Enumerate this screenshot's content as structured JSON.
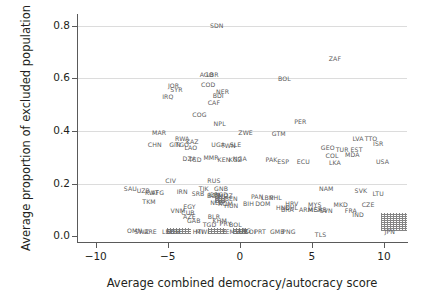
{
  "chart_data": {
    "type": "scatter",
    "title": "",
    "xlabel": "Average combined democracy/autocracy score",
    "ylabel": "Average proportion of excluded population",
    "xlim": [
      -11.3,
      11.6
    ],
    "ylim": [
      -0.022,
      0.845
    ],
    "xticks": [
      -10,
      -5,
      0,
      5,
      10
    ],
    "xtick_labels": [
      "−10",
      "−5",
      "0",
      "5",
      "10"
    ],
    "yticks": [
      0.0,
      0.2,
      0.4,
      0.6,
      0.8
    ],
    "ytick_labels": [
      "0.0",
      "0.2",
      "0.4",
      "0.6",
      "0.8"
    ],
    "grid": "horizontal",
    "legend": "none",
    "marker_style": "text-labels (ISO3 country codes)",
    "grid_color": "#dcdcdc",
    "label_color": "#5b5b5b",
    "axis_color": "#5a5a5a",
    "points": [
      {
        "label": "SDN",
        "x": -1.6,
        "y": 0.805
      },
      {
        "label": "AGO",
        "x": -2.3,
        "y": 0.617
      },
      {
        "label": "LBR",
        "x": -1.9,
        "y": 0.617
      },
      {
        "label": "COD",
        "x": -2.2,
        "y": 0.578
      },
      {
        "label": "JOR",
        "x": -4.6,
        "y": 0.575
      },
      {
        "label": "SYR",
        "x": -4.4,
        "y": 0.558
      },
      {
        "label": "NER",
        "x": -1.2,
        "y": 0.553
      },
      {
        "label": "BDI",
        "x": -1.5,
        "y": 0.538
      },
      {
        "label": "IRQ",
        "x": -5.0,
        "y": 0.535
      },
      {
        "label": "CAF",
        "x": -1.8,
        "y": 0.512
      },
      {
        "label": "COG",
        "x": -2.8,
        "y": 0.465
      },
      {
        "label": "NPL",
        "x": -1.4,
        "y": 0.432
      },
      {
        "label": "ZAF",
        "x": 6.6,
        "y": 0.678
      },
      {
        "label": "BOL",
        "x": 3.1,
        "y": 0.603
      },
      {
        "label": "PER",
        "x": 4.2,
        "y": 0.437
      },
      {
        "label": "MAR",
        "x": -5.6,
        "y": 0.398
      },
      {
        "label": "ZWE",
        "x": 0.4,
        "y": 0.398
      },
      {
        "label": "GTM",
        "x": 2.7,
        "y": 0.392
      },
      {
        "label": "RWA",
        "x": -4.0,
        "y": 0.375
      },
      {
        "label": "KAZ",
        "x": -3.3,
        "y": 0.362
      },
      {
        "label": "CHN",
        "x": -5.9,
        "y": 0.352
      },
      {
        "label": "GIN",
        "x": -4.5,
        "y": 0.352
      },
      {
        "label": "TGO",
        "x": -4.0,
        "y": 0.352
      },
      {
        "label": "UGA",
        "x": -1.5,
        "y": 0.352
      },
      {
        "label": "TWN",
        "x": -0.8,
        "y": 0.348
      },
      {
        "label": "SLE",
        "x": -0.3,
        "y": 0.352
      },
      {
        "label": "LAO",
        "x": -3.4,
        "y": 0.34
      },
      {
        "label": "LVA",
        "x": 8.2,
        "y": 0.372
      },
      {
        "label": "TTO",
        "x": 9.1,
        "y": 0.375
      },
      {
        "label": "ISR",
        "x": 9.6,
        "y": 0.355
      },
      {
        "label": "GEO",
        "x": 6.1,
        "y": 0.34
      },
      {
        "label": "TUR",
        "x": 7.1,
        "y": 0.33
      },
      {
        "label": "EST",
        "x": 8.1,
        "y": 0.33
      },
      {
        "label": "MDA",
        "x": 7.8,
        "y": 0.312
      },
      {
        "label": "COL",
        "x": 6.4,
        "y": 0.31
      },
      {
        "label": "DZA",
        "x": -3.5,
        "y": 0.297
      },
      {
        "label": "TCD",
        "x": -3.1,
        "y": 0.295
      },
      {
        "label": "MMR",
        "x": -2.0,
        "y": 0.3
      },
      {
        "label": "KEN",
        "x": -1.1,
        "y": 0.295
      },
      {
        "label": "KGZ",
        "x": -0.3,
        "y": 0.292
      },
      {
        "label": "NGA",
        "x": 0.0,
        "y": 0.297
      },
      {
        "label": "PAK",
        "x": 2.2,
        "y": 0.292
      },
      {
        "label": "ESP",
        "x": 3.0,
        "y": 0.285
      },
      {
        "label": "ECU",
        "x": 4.4,
        "y": 0.287
      },
      {
        "label": "LKA",
        "x": 6.6,
        "y": 0.283
      },
      {
        "label": "USA",
        "x": 9.9,
        "y": 0.285
      },
      {
        "label": "CIV",
        "x": -4.8,
        "y": 0.215
      },
      {
        "label": "RUS",
        "x": -1.8,
        "y": 0.215
      },
      {
        "label": "SAU",
        "x": -7.6,
        "y": 0.185
      },
      {
        "label": "UZB",
        "x": -6.7,
        "y": 0.175
      },
      {
        "label": "KWT",
        "x": -6.1,
        "y": 0.17
      },
      {
        "label": "AFG",
        "x": -5.7,
        "y": 0.17
      },
      {
        "label": "IRN",
        "x": -4.0,
        "y": 0.173
      },
      {
        "label": "TJK",
        "x": -2.5,
        "y": 0.182
      },
      {
        "label": "GNB",
        "x": -1.3,
        "y": 0.182
      },
      {
        "label": "SRB",
        "x": -2.9,
        "y": 0.165
      },
      {
        "label": "IDN",
        "x": -1.8,
        "y": 0.16
      },
      {
        "label": "BGD",
        "x": -1.3,
        "y": 0.16
      },
      {
        "label": "MOZ",
        "x": -1.0,
        "y": 0.155
      },
      {
        "label": "BEN",
        "x": -0.6,
        "y": 0.145
      },
      {
        "label": "NIC",
        "x": -1.3,
        "y": 0.142
      },
      {
        "label": "NLD",
        "x": -1.6,
        "y": 0.13
      },
      {
        "label": "TKM",
        "x": -6.3,
        "y": 0.135
      },
      {
        "label": "ROM",
        "x": -1.0,
        "y": 0.128
      },
      {
        "label": "HUN",
        "x": -0.6,
        "y": 0.118
      },
      {
        "label": "EGY",
        "x": -3.5,
        "y": 0.115
      },
      {
        "label": "VNM",
        "x": -4.3,
        "y": 0.098
      },
      {
        "label": "CUB",
        "x": -3.6,
        "y": 0.092
      },
      {
        "label": "AZE",
        "x": -3.5,
        "y": 0.078
      },
      {
        "label": "BLR",
        "x": -1.8,
        "y": 0.075
      },
      {
        "label": "KHM",
        "x": -1.4,
        "y": 0.062
      },
      {
        "label": "GAB",
        "x": -3.2,
        "y": 0.06
      },
      {
        "label": "TGD",
        "x": -2.1,
        "y": 0.048
      },
      {
        "label": "PRY",
        "x": -1.0,
        "y": 0.05
      },
      {
        "label": "BOL2",
        "x": -0.3,
        "y": 0.048
      },
      {
        "label": "OMN",
        "x": -7.3,
        "y": 0.022
      },
      {
        "label": "SWZ",
        "x": -6.8,
        "y": 0.02
      },
      {
        "label": "ARE",
        "x": -6.2,
        "y": 0.018
      },
      {
        "label": "LBY",
        "x": -5.0,
        "y": 0.018
      },
      {
        "label": "SOM",
        "x": -4.6,
        "y": 0.018
      },
      {
        "label": "MWI",
        "x": -2.6,
        "y": 0.018
      },
      {
        "label": "HTI",
        "x": -2.9,
        "y": 0.018
      },
      {
        "label": "YEM",
        "x": -0.8,
        "y": 0.018
      },
      {
        "label": "BGD2",
        "x": -1.8,
        "y": 0.155
      },
      {
        "label": "BIH",
        "x": 0.6,
        "y": 0.128
      },
      {
        "label": "DOM",
        "x": 1.6,
        "y": 0.128
      },
      {
        "label": "PAN",
        "x": 1.2,
        "y": 0.152
      },
      {
        "label": "LBN",
        "x": 1.9,
        "y": 0.15
      },
      {
        "label": "PHL",
        "x": 2.5,
        "y": 0.148
      },
      {
        "label": "HRV",
        "x": 3.6,
        "y": 0.125
      },
      {
        "label": "HND",
        "x": 3.0,
        "y": 0.11
      },
      {
        "label": "CHL",
        "x": 3.6,
        "y": 0.112
      },
      {
        "label": "BRA",
        "x": 3.3,
        "y": 0.105
      },
      {
        "label": "MYS",
        "x": 5.2,
        "y": 0.122
      },
      {
        "label": "ARM",
        "x": 4.6,
        "y": 0.102
      },
      {
        "label": "MEX",
        "x": 5.2,
        "y": 0.102
      },
      {
        "label": "SRB2",
        "x": 5.6,
        "y": 0.102
      },
      {
        "label": "MKD",
        "x": 7.0,
        "y": 0.122
      },
      {
        "label": "SVN",
        "x": 6.0,
        "y": 0.098
      },
      {
        "label": "FRA",
        "x": 7.7,
        "y": 0.098
      },
      {
        "label": "CZE",
        "x": 8.9,
        "y": 0.122
      },
      {
        "label": "NAM",
        "x": 6.0,
        "y": 0.182
      },
      {
        "label": "SVK",
        "x": 8.4,
        "y": 0.175
      },
      {
        "label": "LTU",
        "x": 9.6,
        "y": 0.165
      },
      {
        "label": "GMB",
        "x": 2.6,
        "y": 0.018
      },
      {
        "label": "PNG",
        "x": 3.4,
        "y": 0.018
      },
      {
        "label": "TLS",
        "x": 5.6,
        "y": 0.01
      },
      {
        "label": "IND",
        "x": 8.2,
        "y": 0.085
      },
      {
        "label": "ARG",
        "x": 0.3,
        "y": 0.022
      },
      {
        "label": "COI",
        "x": 0.7,
        "y": 0.018
      },
      {
        "label": "PRT",
        "x": 1.4,
        "y": 0.018
      },
      {
        "label": "SUR",
        "x": 0.1,
        "y": 0.018
      },
      {
        "label": "JPN",
        "x": 10.4,
        "y": 0.018
      }
    ],
    "overplot_blobs": [
      {
        "x": 10.7,
        "y": 0.055,
        "w": 26,
        "h": 18,
        "note": "dense unreadable cluster of overlapping labels at high democracy score, near-zero exclusion"
      },
      {
        "x": -4.2,
        "y": 0.018,
        "w": 24,
        "h": 6,
        "note": "overlapping bottom-row labels"
      },
      {
        "x": -1.6,
        "y": 0.018,
        "w": 18,
        "h": 6,
        "note": "overlapping bottom-row labels"
      },
      {
        "x": 0.0,
        "y": 0.018,
        "w": 14,
        "h": 6,
        "note": "overlapping bottom-row labels"
      },
      {
        "x": -1.4,
        "y": 0.138,
        "w": 10,
        "h": 6,
        "note": "overlapping labels"
      }
    ]
  }
}
